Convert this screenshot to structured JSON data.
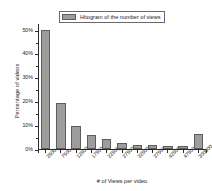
{
  "chart_data": {
    "type": "bar",
    "title": "",
    "legend": [
      "Hitogram of the number of views"
    ],
    "legend_position": "top-center",
    "xlabel": "# of Views per video",
    "ylabel": "Percentage of videos",
    "categories": [
      "2500",
      "7500",
      "12500",
      "17500",
      "22500",
      "27500",
      "32500",
      "37500",
      "42500",
      "47500",
      "300000"
    ],
    "values": [
      50.0,
      19.5,
      9.7,
      5.7,
      4.1,
      2.4,
      1.8,
      1.8,
      1.2,
      1.1,
      6.5
    ],
    "ylim": [
      0,
      53
    ],
    "ytick_values": [
      0,
      10,
      20,
      30,
      40,
      50
    ],
    "ytick_labels": [
      "0%",
      "10%",
      "20%",
      "30%",
      "40%",
      "50%"
    ],
    "grid": false,
    "bar_color": "#9d9d9d",
    "bar_edge_color": "#5d5d5d",
    "axis_color": "#2b2b2b"
  }
}
